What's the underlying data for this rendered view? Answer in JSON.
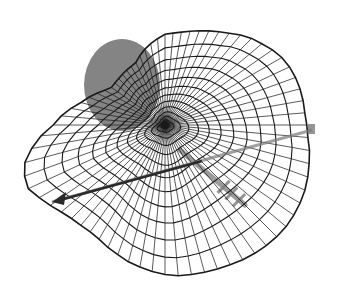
{
  "figure": {
    "kind": "3D wireframe polar mesh surface",
    "background": "#ffffff",
    "mesh_color": "#1a1a1a",
    "sphere_color": "#6e6e6e",
    "arrow_color": "#2a2a2a",
    "axis_color": "#7a7a7a",
    "center": [
      165,
      125
    ],
    "rings": 14,
    "spokes": 72,
    "outline": [
      [
        165,
        30
      ],
      [
        195,
        28
      ],
      [
        225,
        38
      ],
      [
        255,
        52
      ],
      [
        285,
        70
      ],
      [
        308,
        95
      ],
      [
        320,
        125
      ],
      [
        322,
        155
      ],
      [
        312,
        185
      ],
      [
        295,
        210
      ],
      [
        272,
        235
      ],
      [
        245,
        255
      ],
      [
        210,
        268
      ],
      [
        175,
        270
      ],
      [
        145,
        262
      ],
      [
        118,
        252
      ],
      [
        92,
        240
      ],
      [
        62,
        228
      ],
      [
        35,
        210
      ],
      [
        22,
        192
      ],
      [
        24,
        168
      ],
      [
        40,
        145
      ],
      [
        62,
        125
      ],
      [
        85,
        105
      ],
      [
        110,
        88
      ],
      [
        135,
        62
      ]
    ],
    "sphere": {
      "cx": 122,
      "cy": 85,
      "rx": 38,
      "ry": 46
    },
    "arrow": {
      "x1": 312,
      "y1": 130,
      "x2": 52,
      "y2": 202
    },
    "tick_axis": {
      "x1": 180,
      "y1": 150,
      "x2": 245,
      "y2": 205
    }
  }
}
